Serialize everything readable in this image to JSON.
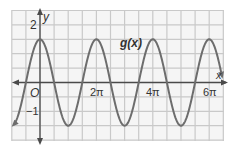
{
  "chart_data": {
    "type": "line",
    "title": "",
    "function_label": "g(x)",
    "xlabel": "x",
    "ylabel": "y",
    "origin_label": "O",
    "x_tick_labels": [
      "2π",
      "4π",
      "6π"
    ],
    "x_tick_values_pi": [
      2,
      4,
      6
    ],
    "y_tick_labels": [
      "2",
      "−1"
    ],
    "y_tick_values": [
      2,
      -1
    ],
    "grid": true,
    "grid_x_step": "π/2",
    "grid_y_step": 0.5,
    "xlim_pi": [
      -1,
      6.5
    ],
    "ylim": [
      -2,
      2.5
    ],
    "series": [
      {
        "name": "g(x)",
        "equation_estimate": "1.5·cos(x)",
        "amplitude": 1.5,
        "period": "2π",
        "maxima_x_pi": [
          0,
          2,
          4,
          6
        ],
        "minima_x_pi": [
          1,
          3,
          5
        ],
        "max_value": 1.5,
        "min_value": -1.5
      }
    ],
    "colors": {
      "curve": "#6b6b6b",
      "grid": "#c8c8c8",
      "axis": "#4a4a4a",
      "background": "#f4f4f4"
    }
  }
}
